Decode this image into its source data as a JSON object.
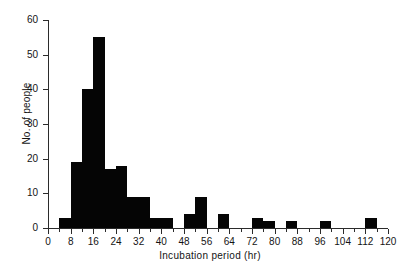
{
  "chart_data": {
    "type": "bar",
    "title": "",
    "subtitle": "",
    "xlabel": "Incubation period (hr)",
    "ylabel": "No. of people",
    "xlim": [
      0,
      120
    ],
    "ylim": [
      0,
      60
    ],
    "grid": false,
    "legend": null,
    "bin_width": 4,
    "bar_color": "#050505",
    "axis_color": "#2b2b2b",
    "y_ticks": [
      0,
      10,
      20,
      30,
      40,
      50,
      60
    ],
    "y_tick_labels": [
      "0",
      "10",
      "20",
      "30",
      "40",
      "50",
      "60"
    ],
    "x_ticks": [
      0,
      8,
      16,
      24,
      32,
      40,
      48,
      56,
      64,
      72,
      80,
      88,
      96,
      104,
      112,
      120
    ],
    "x_tick_labels": [
      "0",
      "8",
      "16",
      "24",
      "32",
      "40",
      "48",
      "56",
      "64",
      "72",
      "80",
      "88",
      "96",
      "104",
      "112",
      "120"
    ],
    "x_minor_tick_step": 4,
    "bins": [
      {
        "start": 0,
        "end": 4,
        "value": 0
      },
      {
        "start": 4,
        "end": 8,
        "value": 3
      },
      {
        "start": 8,
        "end": 12,
        "value": 19
      },
      {
        "start": 12,
        "end": 16,
        "value": 40
      },
      {
        "start": 16,
        "end": 20,
        "value": 55
      },
      {
        "start": 20,
        "end": 24,
        "value": 17
      },
      {
        "start": 24,
        "end": 28,
        "value": 18
      },
      {
        "start": 28,
        "end": 32,
        "value": 9
      },
      {
        "start": 32,
        "end": 36,
        "value": 9
      },
      {
        "start": 36,
        "end": 40,
        "value": 3
      },
      {
        "start": 40,
        "end": 44,
        "value": 3
      },
      {
        "start": 44,
        "end": 48,
        "value": 0
      },
      {
        "start": 48,
        "end": 52,
        "value": 4
      },
      {
        "start": 52,
        "end": 56,
        "value": 9
      },
      {
        "start": 56,
        "end": 60,
        "value": 0
      },
      {
        "start": 60,
        "end": 64,
        "value": 4
      },
      {
        "start": 64,
        "end": 68,
        "value": 0
      },
      {
        "start": 68,
        "end": 72,
        "value": 0
      },
      {
        "start": 72,
        "end": 76,
        "value": 3
      },
      {
        "start": 76,
        "end": 80,
        "value": 2
      },
      {
        "start": 80,
        "end": 84,
        "value": 0
      },
      {
        "start": 84,
        "end": 88,
        "value": 2
      },
      {
        "start": 88,
        "end": 92,
        "value": 0
      },
      {
        "start": 92,
        "end": 96,
        "value": 0
      },
      {
        "start": 96,
        "end": 100,
        "value": 2
      },
      {
        "start": 100,
        "end": 104,
        "value": 0
      },
      {
        "start": 104,
        "end": 108,
        "value": 0
      },
      {
        "start": 108,
        "end": 112,
        "value": 0
      },
      {
        "start": 112,
        "end": 116,
        "value": 3
      },
      {
        "start": 116,
        "end": 120,
        "value": 0
      }
    ],
    "categories": [
      "0-4",
      "4-8",
      "8-12",
      "12-16",
      "16-20",
      "20-24",
      "24-28",
      "28-32",
      "32-36",
      "36-40",
      "40-44",
      "44-48",
      "48-52",
      "52-56",
      "56-60",
      "60-64",
      "64-68",
      "68-72",
      "72-76",
      "76-80",
      "80-84",
      "84-88",
      "88-92",
      "92-96",
      "96-100",
      "100-104",
      "104-108",
      "108-112",
      "112-116",
      "116-120"
    ],
    "values": [
      0,
      3,
      19,
      40,
      55,
      17,
      18,
      9,
      9,
      3,
      3,
      0,
      4,
      9,
      0,
      4,
      0,
      0,
      3,
      2,
      0,
      2,
      0,
      0,
      2,
      0,
      0,
      0,
      3,
      0
    ]
  },
  "edge_fragment": {
    "text": ""
  }
}
